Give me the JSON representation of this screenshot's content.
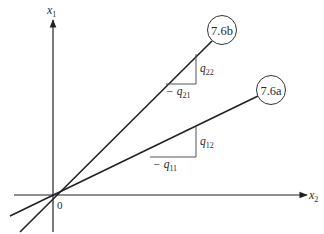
{
  "axes": {
    "vertical_label": "x",
    "vertical_sub": "1",
    "horizontal_label": "x",
    "horizontal_sub": "2",
    "origin_label": "0"
  },
  "lines": [
    {
      "id": "7.6b",
      "label": "7.6b",
      "triangle": {
        "rise_label": "q",
        "rise_sub": "22",
        "run_label": "− q",
        "run_sub": "21"
      }
    },
    {
      "id": "7.6a",
      "label": "7.6a",
      "triangle": {
        "rise_label": "q",
        "rise_sub": "12",
        "run_label": "− q",
        "run_sub": "11"
      }
    }
  ],
  "colors": {
    "stroke": "#222222",
    "triangle_stroke": "#555555",
    "background": "#ffffff"
  }
}
